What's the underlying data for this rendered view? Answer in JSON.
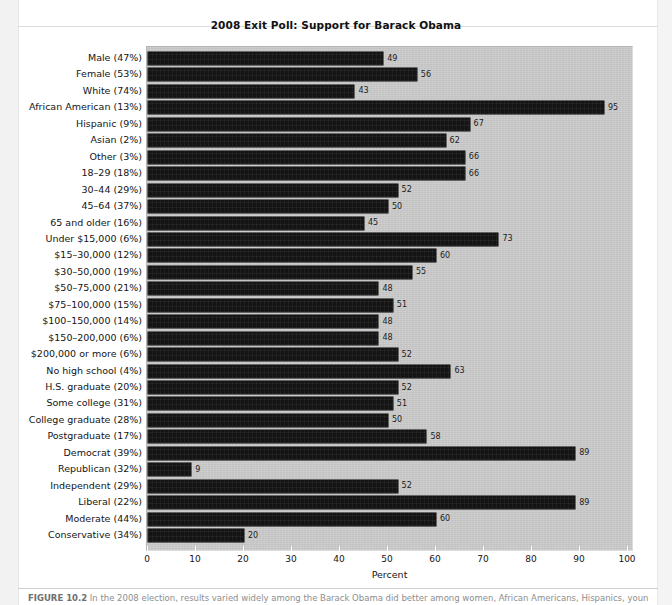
{
  "figure": {
    "caption_label": "FIGURE 10.2",
    "caption_text": "In the 2008 election, results varied widely among the Barack Obama did better among women, African Americans, Hispanics, younger voters, and"
  },
  "chart_data": {
    "type": "bar",
    "orientation": "horizontal",
    "title": "2008 Exit Poll: Support for Barack Obama",
    "xlabel": "Percent",
    "ylabel": "",
    "xlim": [
      0,
      100
    ],
    "xticks": [
      0,
      10,
      20,
      30,
      40,
      50,
      60,
      70,
      80,
      90,
      100
    ],
    "grid": false,
    "legend": "none",
    "bar_color": "#141414",
    "panel_color": "#c9c9c9",
    "value_labels_shown": true,
    "categories": [
      "Male (47%)",
      "Female (53%)",
      "White (74%)",
      "African American (13%)",
      "Hispanic (9%)",
      "Asian (2%)",
      "Other (3%)",
      "18–29 (18%)",
      "30–44 (29%)",
      "45–64 (37%)",
      "65 and older (16%)",
      "Under $15,000 (6%)",
      "$15–30,000 (12%)",
      "$30–50,000 (19%)",
      "$50–75,000 (21%)",
      "$75–100,000 (15%)",
      "$100–150,000 (14%)",
      "$150–200,000 (6%)",
      "$200,000 or more (6%)",
      "No high school (4%)",
      "H.S. graduate (20%)",
      "Some college (31%)",
      "College graduate (28%)",
      "Postgraduate (17%)",
      "Democrat (39%)",
      "Republican (32%)",
      "Independent (29%)",
      "Liberal (22%)",
      "Moderate (44%)",
      "Conservative (34%)"
    ],
    "values": [
      49,
      56,
      43,
      95,
      67,
      62,
      66,
      66,
      52,
      50,
      45,
      73,
      60,
      55,
      48,
      51,
      48,
      48,
      52,
      63,
      52,
      51,
      50,
      58,
      89,
      9,
      52,
      89,
      60,
      20
    ]
  }
}
